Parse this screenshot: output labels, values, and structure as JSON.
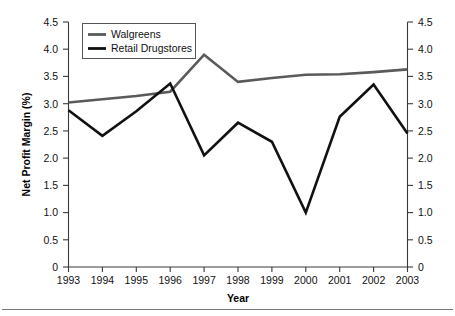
{
  "chart_data": {
    "type": "line",
    "title": "",
    "xlabel": "Year",
    "ylabel": "Net Profit Margin (%)",
    "x": [
      1993,
      1994,
      1995,
      1996,
      1997,
      1998,
      1999,
      2000,
      2001,
      2002,
      2003
    ],
    "categories": [
      "1993",
      "1994",
      "1995",
      "1996",
      "1997",
      "1998",
      "1999",
      "2000",
      "2001",
      "2002",
      "2003"
    ],
    "series": [
      {
        "name": "Walgreens",
        "color": "#5a5a5a",
        "values": [
          3.02,
          3.08,
          3.14,
          3.22,
          3.9,
          3.4,
          3.47,
          3.53,
          3.54,
          3.58,
          3.63
        ]
      },
      {
        "name": "Retail Drugstores",
        "color": "#111111",
        "values": [
          2.88,
          2.41,
          2.86,
          3.37,
          2.05,
          2.65,
          2.3,
          1.0,
          2.76,
          3.35,
          2.45
        ]
      }
    ],
    "ylim": [
      0,
      4.5
    ],
    "ytick_labels": [
      "4.5",
      "4.0",
      "3.5",
      "3.0",
      "2.5",
      "2.0",
      "1.5",
      "1.0",
      "0.5",
      "0"
    ],
    "ytick_values": [
      4.5,
      4.0,
      3.5,
      3.0,
      2.5,
      2.0,
      1.5,
      1.0,
      0.5,
      0
    ],
    "right_axis": {
      "mirrored": true,
      "ytick_labels": [
        "4.5",
        "4.0",
        "3.5",
        "3.0",
        "2.5",
        "2.0",
        "1.5",
        "1.0",
        "0.5",
        "0"
      ]
    },
    "grid": false,
    "legend_position": "top-left"
  },
  "legend": {
    "entries": [
      {
        "label": "Walgreens",
        "color": "#5a5a5a"
      },
      {
        "label": "Retail Drugstores",
        "color": "#111111"
      }
    ]
  }
}
